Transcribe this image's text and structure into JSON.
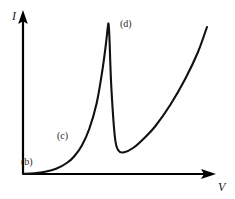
{
  "chart_data": {
    "type": "line",
    "title": "",
    "xlabel": "V",
    "ylabel": "I",
    "grid": false,
    "legend": false,
    "axis_style": "arrow",
    "annotations": [
      {
        "label": "(b)",
        "x": 0.0,
        "y": 0.0
      },
      {
        "label": "(c)",
        "x": 0.26,
        "y": 0.2
      },
      {
        "label": "(d)",
        "x": 0.52,
        "y": 0.98
      }
    ],
    "series": [
      {
        "name": "I-V curve",
        "color": "#111111",
        "x": [
          0.0,
          0.06,
          0.12,
          0.18,
          0.24,
          0.28,
          0.32,
          0.36,
          0.4,
          0.43,
          0.45,
          0.46,
          0.465,
          0.47,
          0.48,
          0.5,
          0.52,
          0.55,
          0.6,
          0.66,
          0.72,
          0.8,
          0.88,
          0.95,
          1.0
        ],
        "y": [
          0.0,
          0.005,
          0.015,
          0.035,
          0.075,
          0.12,
          0.19,
          0.3,
          0.47,
          0.68,
          0.86,
          0.97,
          1.0,
          0.9,
          0.58,
          0.24,
          0.155,
          0.145,
          0.175,
          0.24,
          0.32,
          0.46,
          0.63,
          0.81,
          0.98
        ]
      }
    ],
    "xlim": [
      0,
      1
    ],
    "ylim": [
      0,
      1
    ],
    "xticks": [],
    "yticks": []
  },
  "axes": {
    "y_label": "I",
    "x_label": "V"
  },
  "labels": {
    "b": "(b)",
    "c": "(c)",
    "d": "(d)"
  },
  "colors": {
    "curve": "#111111",
    "axis": "#000000",
    "background": "#ffffff",
    "label_text": "#2b2b2b"
  }
}
